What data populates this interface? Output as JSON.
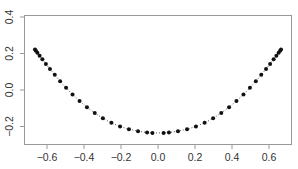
{
  "chart_data": {
    "type": "scatter",
    "title": "",
    "xlabel": "",
    "ylabel": "",
    "xlim": [
      -0.72,
      0.72
    ],
    "ylim": [
      -0.29,
      0.41
    ],
    "xticks": [
      -0.6,
      -0.4,
      -0.2,
      0.0,
      0.2,
      0.4,
      0.6
    ],
    "xtick_labels": [
      "−0.6",
      "−0.4",
      "−0.2",
      "0.0",
      "0.2",
      "0.4",
      "0.6"
    ],
    "yticks": [
      -0.2,
      0.0,
      0.2,
      0.4
    ],
    "ytick_labels": [
      "−0.2",
      "0.0",
      "0.2",
      "0.4"
    ],
    "grid": false,
    "legend": null,
    "line_style": "dotted",
    "marker": "filled-circle",
    "series": [
      {
        "name": "curve",
        "x": [
          -0.665,
          -0.66,
          -0.652,
          -0.64,
          -0.625,
          -0.606,
          -0.584,
          -0.558,
          -0.529,
          -0.497,
          -0.462,
          -0.424,
          -0.384,
          -0.342,
          -0.298,
          -0.252,
          -0.205,
          -0.157,
          -0.108,
          -0.059,
          -0.03,
          0.03,
          0.059,
          0.108,
          0.157,
          0.205,
          0.252,
          0.298,
          0.342,
          0.384,
          0.424,
          0.462,
          0.497,
          0.529,
          0.558,
          0.584,
          0.606,
          0.625,
          0.64,
          0.652,
          0.66,
          0.665
        ],
        "y": [
          0.222,
          0.215,
          0.204,
          0.188,
          0.168,
          0.143,
          0.115,
          0.083,
          0.048,
          0.012,
          -0.024,
          -0.06,
          -0.094,
          -0.126,
          -0.155,
          -0.18,
          -0.2,
          -0.215,
          -0.226,
          -0.233,
          -0.235,
          -0.235,
          -0.233,
          -0.226,
          -0.215,
          -0.2,
          -0.18,
          -0.155,
          -0.126,
          -0.094,
          -0.06,
          -0.024,
          0.012,
          0.048,
          0.083,
          0.115,
          0.143,
          0.168,
          0.188,
          0.204,
          0.215,
          0.222
        ]
      }
    ]
  }
}
